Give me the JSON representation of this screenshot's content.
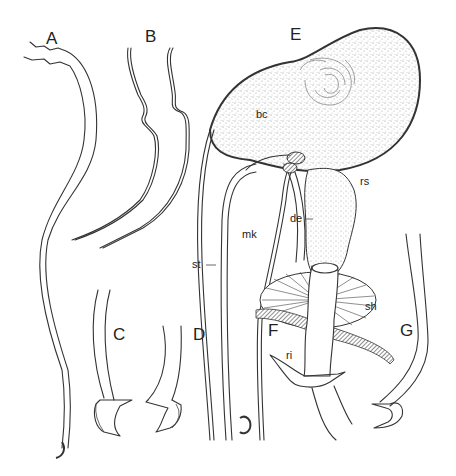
{
  "figure": {
    "panels": [
      {
        "id": "A",
        "label": "A",
        "subject": "long slender sclerotized duct with hooked tip"
      },
      {
        "id": "B",
        "label": "B",
        "subject": "two wavy curved ducts"
      },
      {
        "id": "C",
        "label": "C",
        "subject": "duct tip with toothed hook"
      },
      {
        "id": "D",
        "label": "D",
        "subject": "duct tip with toothed hook"
      },
      {
        "id": "E",
        "label": "E",
        "subject": "reproductive organ overview"
      },
      {
        "id": "F",
        "label": "F",
        "subject": "duct with sheath and ring"
      },
      {
        "id": "G",
        "label": "G",
        "subject": "duct tip with toothed hook"
      }
    ],
    "annotations": {
      "bc": "bc",
      "rs": "rs",
      "de": "de",
      "mk": "mk",
      "st": "st",
      "sh": "sh",
      "ri": "ri"
    }
  },
  "colors": {
    "ink": "#333333",
    "stipple": "#bdbdbd",
    "background": "#ffffff"
  }
}
